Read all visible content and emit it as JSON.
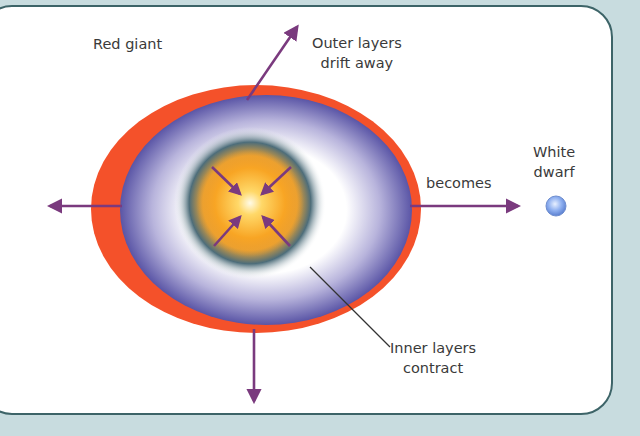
{
  "diagram": {
    "title_label": "Red giant",
    "outer_layers_label": {
      "line1": "Outer layers",
      "line2": "drift away"
    },
    "becomes_label": "becomes",
    "white_dwarf_label": {
      "line1": "White",
      "line2": "dwarf"
    },
    "inner_layers_label": {
      "line1": "Inner layers",
      "line2": "contract"
    },
    "colors": {
      "background": "#c8dcdf",
      "panel_border": "#3d6468",
      "red_layer": "#f4512a",
      "purple_layer": "#5e5aa8",
      "core_halo": "#4e6e7c",
      "core": "#f7a21c",
      "arrow": "#7a3a7e",
      "white_dwarf": "#7f9fe6"
    },
    "arrows": [
      "up-right: outer layers drift away",
      "left: outward",
      "down: outward",
      "right: becomes white dwarf",
      "4 inward: inner layers contract"
    ]
  }
}
